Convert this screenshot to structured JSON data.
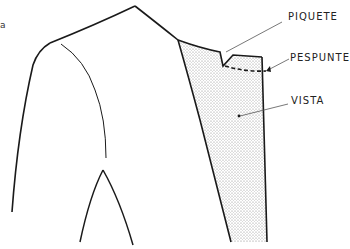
{
  "diagram": {
    "type": "garment technical illustration",
    "fragment_text": "a",
    "labels": [
      {
        "id": "piquete",
        "text": "PIQUETE"
      },
      {
        "id": "pespunte",
        "text": "PESPUNTE"
      },
      {
        "id": "vista",
        "text": "VISTA"
      }
    ],
    "colors": {
      "line": "#1a1a1a",
      "leader": "#555555",
      "stipple": "#9a9a9a",
      "background": "#ffffff"
    }
  }
}
